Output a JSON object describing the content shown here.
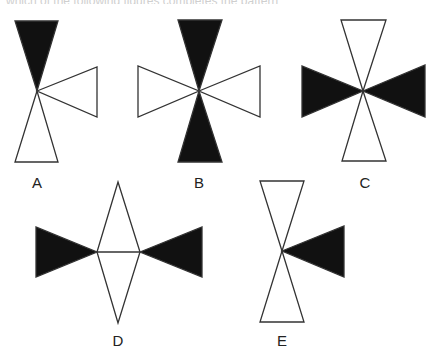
{
  "header": {
    "clipped_text": "which of the following figures completes the pattern"
  },
  "colors": {
    "fill_dark": "#111111",
    "stroke": "#333333",
    "background": "#ffffff"
  },
  "figures": [
    {
      "label": "A",
      "top": "black",
      "bottom": "white",
      "left": "none",
      "right": "white"
    },
    {
      "label": "B",
      "top": "black",
      "bottom": "black",
      "left": "white",
      "right": "white"
    },
    {
      "label": "C",
      "top": "white",
      "bottom": "white",
      "left": "black",
      "right": "black"
    },
    {
      "label": "D",
      "top": "white-diamond-half",
      "bottom": "white-diamond-half",
      "left": "black",
      "right": "black"
    },
    {
      "label": "E",
      "top": "white",
      "bottom": "white",
      "left": "none",
      "right": "black"
    }
  ]
}
